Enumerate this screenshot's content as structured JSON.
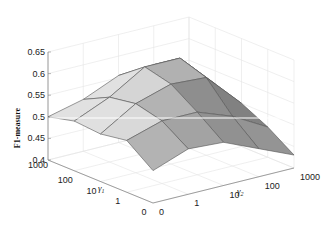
{
  "chart_data": {
    "type": "surface3d",
    "title": "",
    "zlabel": "F1-measure",
    "xlabel": "γ1",
    "ylabel": "γ2",
    "x_ticks": [
      "0",
      "1",
      "10",
      "100",
      "1000"
    ],
    "y_ticks": [
      "0",
      "1",
      "10",
      "100",
      "1000"
    ],
    "z_ticks": [
      "0.4",
      "0.45",
      "0.5",
      "0.55",
      "0.6",
      "0.65"
    ],
    "zlim": [
      0.4,
      0.65
    ],
    "grid": true,
    "colormap": "gray",
    "gamma1_values": [
      "0",
      "1",
      "10",
      "100",
      "1000"
    ],
    "gamma2_values": [
      "0",
      "1",
      "10",
      "100",
      "1000"
    ],
    "z_matrix_rows_gamma1_cols_gamma2": [
      [
        0.475,
        0.505,
        0.5,
        0.465,
        0.43
      ],
      [
        0.52,
        0.545,
        0.545,
        0.515,
        0.47
      ],
      [
        0.51,
        0.56,
        0.585,
        0.58,
        0.5
      ],
      [
        0.515,
        0.55,
        0.6,
        0.6,
        0.52
      ],
      [
        0.5,
        0.52,
        0.555,
        0.56,
        0.53
      ]
    ],
    "reference_line": {
      "z": 0.49,
      "color": "#ffffff"
    }
  },
  "colors": {
    "grid": "#e4e4e4",
    "axis": "#888888",
    "edge": "#555555",
    "face_light": "#d2d2d2",
    "face_dark": "#5a5a5a"
  }
}
